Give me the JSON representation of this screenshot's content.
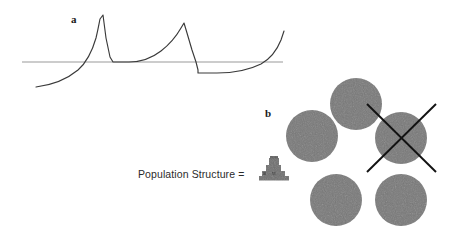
{
  "figure": {
    "width": 457,
    "height": 231,
    "background": "#ffffff"
  },
  "panel_a": {
    "label": "a",
    "label_x": 71,
    "label_y": 23,
    "baseline": {
      "name": "reference-line",
      "color": "#9a9a9a",
      "x1": 22,
      "x2": 283,
      "y": 62,
      "width": 1.1
    },
    "curve": {
      "name": "relaxation-oscillation-curve",
      "color": "#3a3a3a",
      "width": 1.1,
      "description": "two exponential rises with sharp linear drops crossing the baseline",
      "path": "M 36 87 C 52 85 66 80 78 70 C 86 63 92 52 96 38 C 98 30 99 24 100 19 L 103 15 L 106 38 L 110 57 L 113 62 L 129 62 C 141 62 152 58 161 51 C 170 44 177 35 181 28 L 184 23 L 187 33 L 192 50 L 196 62 L 198 70 L 198 73 L 217 73 C 233 73 249 70 261 64 C 270 59 277 50 281 40 L 284 31"
    }
  },
  "panel_b": {
    "label": "b",
    "label_x": 265,
    "label_y": 117,
    "legend": {
      "text": "Population Structure =",
      "text_x": 138,
      "text_y": 178
    },
    "glyph": {
      "name": "stepped-pyramid-glyph",
      "color": "#6e6e6e",
      "shadow_color": "#555555",
      "x": 259,
      "y": 156,
      "width": 30,
      "height": 24,
      "steps": 4
    },
    "circle_style": {
      "fill": "#787878",
      "radius": 26
    },
    "circles": [
      {
        "name": "population-circle-top",
        "cx": 356,
        "cy": 104,
        "r": 26,
        "crossed_out": false
      },
      {
        "name": "population-circle-left",
        "cx": 312,
        "cy": 136,
        "r": 26,
        "crossed_out": false
      },
      {
        "name": "population-circle-right",
        "cx": 401,
        "cy": 138,
        "r": 26,
        "crossed_out": true
      },
      {
        "name": "population-circle-bottom-left",
        "cx": 336,
        "cy": 200,
        "r": 26,
        "crossed_out": false
      },
      {
        "name": "population-circle-bottom-right",
        "cx": 401,
        "cy": 200,
        "r": 26,
        "crossed_out": false
      }
    ],
    "cross_mark": {
      "name": "extinction-cross-mark",
      "color": "#121212",
      "width": 1.9,
      "cx": 401,
      "cy": 138,
      "half": 35
    }
  }
}
